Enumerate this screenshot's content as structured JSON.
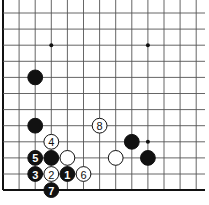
{
  "diagram": {
    "board": {
      "origin_x": 3,
      "origin_y": 13,
      "spacing": 16.1,
      "cols": 13,
      "rows": 12,
      "left_edge": true,
      "bottom_edge": true,
      "top_open": true,
      "right_open": true,
      "line_color": "#555555",
      "edge_color": "#111111",
      "background": "#ffffff"
    },
    "star_points": [
      {
        "col": 3,
        "row": 2
      },
      {
        "col": 9,
        "row": 2
      },
      {
        "col": 9,
        "row": 8
      }
    ],
    "stones": [
      {
        "color": "black",
        "col": 2,
        "row": 4,
        "label": ""
      },
      {
        "color": "black",
        "col": 2,
        "row": 7,
        "label": ""
      },
      {
        "color": "white",
        "col": 6,
        "row": 7,
        "label": "8"
      },
      {
        "color": "white",
        "col": 3,
        "row": 8,
        "label": "4"
      },
      {
        "color": "black",
        "col": 2,
        "row": 9,
        "label": "5"
      },
      {
        "color": "black",
        "col": 3,
        "row": 9,
        "label": ""
      },
      {
        "color": "white",
        "col": 4,
        "row": 9,
        "label": ""
      },
      {
        "color": "black",
        "col": 2,
        "row": 10,
        "label": "3"
      },
      {
        "color": "white",
        "col": 3,
        "row": 10,
        "label": "2"
      },
      {
        "color": "black",
        "col": 4,
        "row": 10,
        "label": "1"
      },
      {
        "color": "white",
        "col": 5,
        "row": 10,
        "label": "6"
      },
      {
        "color": "black",
        "col": 3,
        "row": 11,
        "label": "7"
      },
      {
        "color": "black",
        "col": 8,
        "row": 8,
        "label": ""
      },
      {
        "color": "white",
        "col": 7,
        "row": 9,
        "label": ""
      },
      {
        "color": "black",
        "col": 9,
        "row": 9,
        "label": ""
      }
    ]
  }
}
